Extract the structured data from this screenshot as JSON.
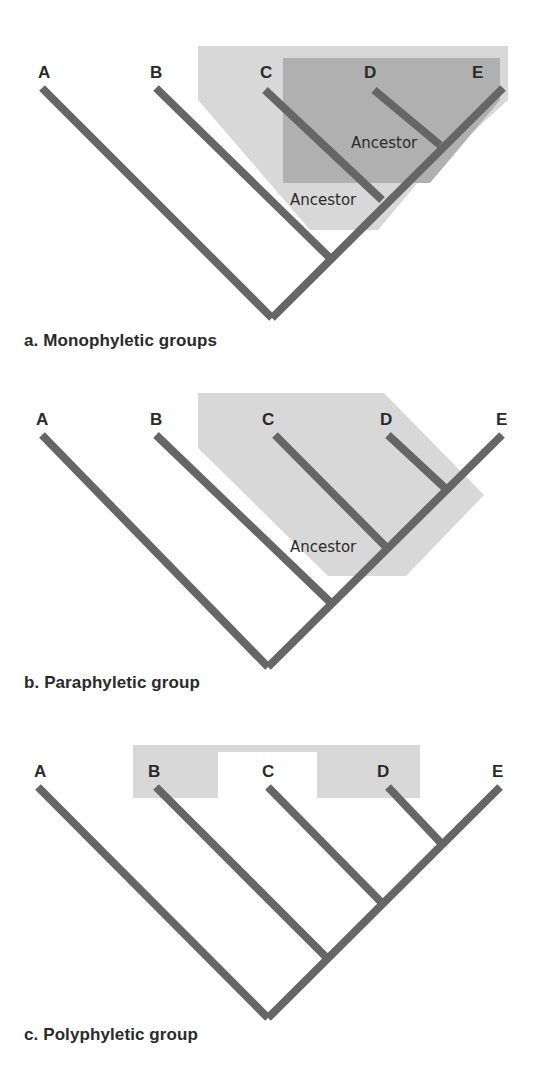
{
  "taxa": [
    "A",
    "B",
    "C",
    "D",
    "E"
  ],
  "panels": [
    {
      "id": "a",
      "caption": "a. Monophyletic groups",
      "ancestor_labels": [
        "Ancestor",
        "Ancestor"
      ],
      "shading": [
        {
          "color": "#d8d8d8",
          "covers": [
            "C",
            "D",
            "E"
          ]
        },
        {
          "color": "#b0b0b0",
          "covers": [
            "D",
            "E"
          ]
        }
      ]
    },
    {
      "id": "b",
      "caption": "b. Paraphyletic group",
      "ancestor_labels": [
        "Ancestor"
      ],
      "shading": [
        {
          "color": "#d8d8d8",
          "covers": [
            "C",
            "D"
          ]
        }
      ]
    },
    {
      "id": "c",
      "caption": "c. Polyphyletic group",
      "ancestor_labels": [],
      "shading": [
        {
          "color": "#d8d8d8",
          "covers": [
            "B",
            "D"
          ]
        }
      ]
    }
  ],
  "colors": {
    "branch": "#666666",
    "light_shade": "#d8d8d8",
    "dark_shade": "#b0b0b0",
    "text": "#2a2a2a"
  }
}
